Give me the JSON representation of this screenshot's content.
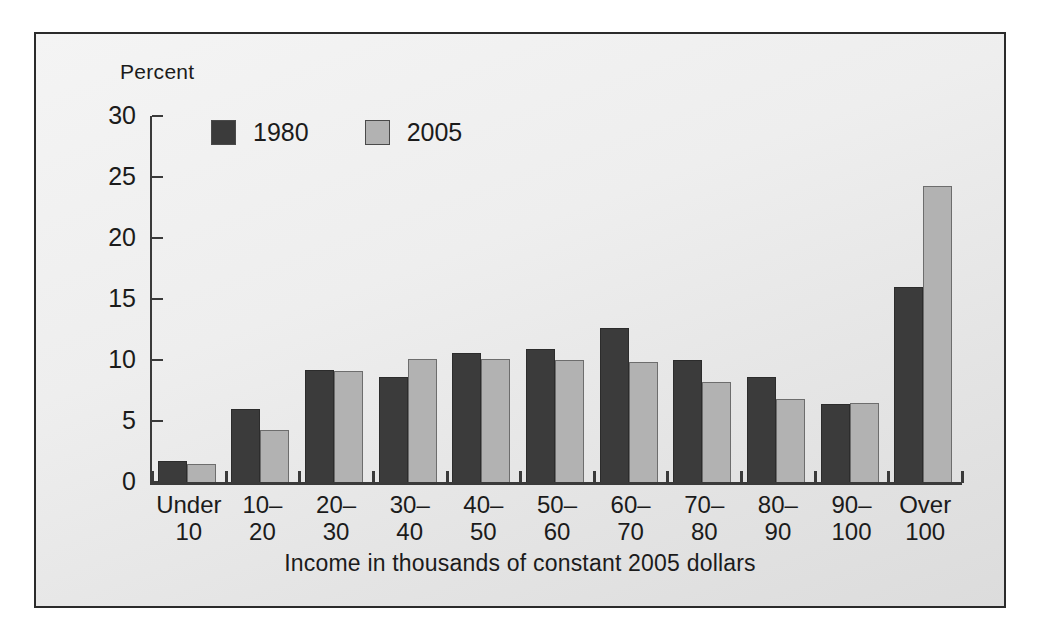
{
  "chart_data": {
    "type": "bar",
    "title": "",
    "xlabel": "Income in thousands of constant 2005 dollars",
    "ylabel": "Percent",
    "ylim": [
      0,
      30
    ],
    "yticks": [
      0,
      5,
      10,
      15,
      20,
      25,
      30
    ],
    "ytick_labels": [
      "0",
      "5",
      "10",
      "15",
      "20",
      "25",
      "30"
    ],
    "grid": false,
    "legend_position": "top-left-inside",
    "categories": [
      "Under 10",
      "10-20",
      "20-30",
      "30-40",
      "40-50",
      "50-60",
      "60-70",
      "70-80",
      "80-90",
      "90-100",
      "Over 100"
    ],
    "category_lines": [
      [
        "Under",
        "10"
      ],
      [
        "10–",
        "20"
      ],
      [
        "20–",
        "30"
      ],
      [
        "30–",
        "40"
      ],
      [
        "40–",
        "50"
      ],
      [
        "50–",
        "60"
      ],
      [
        "60–",
        "70"
      ],
      [
        "70–",
        "80"
      ],
      [
        "80–",
        "90"
      ],
      [
        "90–",
        "100"
      ],
      [
        "Over",
        "100"
      ]
    ],
    "series": [
      {
        "name": "1980",
        "color": "#3b3b3b",
        "values": [
          1.7,
          6.0,
          9.2,
          8.6,
          10.6,
          10.9,
          12.6,
          10.0,
          8.6,
          6.4,
          16.0
        ]
      },
      {
        "name": "2005",
        "color": "#b2b2b2",
        "values": [
          1.5,
          4.3,
          9.1,
          10.1,
          10.1,
          10.0,
          9.8,
          8.2,
          6.8,
          6.5,
          24.3
        ]
      }
    ]
  },
  "legend": {
    "entries": [
      {
        "label": "1980",
        "color": "#3b3b3b"
      },
      {
        "label": "2005",
        "color": "#b2b2b2"
      }
    ]
  },
  "axis": {
    "y_title": "Percent",
    "x_title": "Income in thousands of constant 2005 dollars"
  },
  "colors": {
    "series_1980": "#3b3b3b",
    "series_2005": "#b2b2b2",
    "axis": "#3a3a3a",
    "frame_border": "#2b2b2b",
    "text": "#1b1b1b",
    "panel_background": "#ececec"
  }
}
